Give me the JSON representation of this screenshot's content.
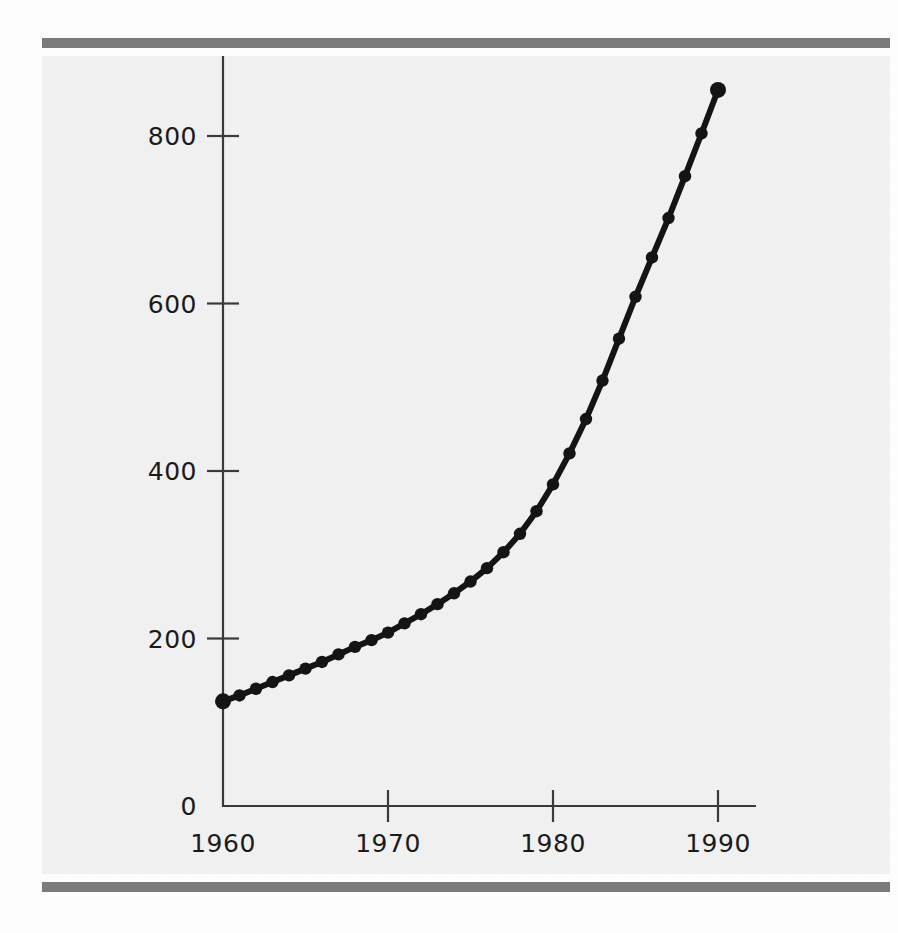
{
  "figure": {
    "background_color": "#f1f1f1",
    "rule_color": "#7b7b7b",
    "ink_color": "#141414",
    "axis_color": "#3a3a3a"
  },
  "chart_data": {
    "type": "line",
    "title": "",
    "subtitle": "",
    "xlabel": "",
    "ylabel": "",
    "xlim": [
      1960,
      1990
    ],
    "ylim": [
      0,
      900
    ],
    "xticks": [
      1960,
      1970,
      1980,
      1990
    ],
    "xtick_labels": [
      "1960",
      "1970",
      "1980",
      "1990"
    ],
    "yticks": [
      0,
      200,
      400,
      600,
      800
    ],
    "ytick_labels": [
      "0",
      "200",
      "400",
      "600",
      "800"
    ],
    "grid": false,
    "legend": null,
    "markers": "filled-circle",
    "annotations": [],
    "series": [
      {
        "name": "series-1",
        "color": "#141414",
        "x": [
          1960,
          1961,
          1962,
          1963,
          1964,
          1965,
          1966,
          1967,
          1968,
          1969,
          1970,
          1971,
          1972,
          1973,
          1974,
          1975,
          1976,
          1977,
          1978,
          1979,
          1980,
          1981,
          1982,
          1983,
          1984,
          1985,
          1986,
          1987,
          1988,
          1989,
          1990
        ],
        "values": [
          125,
          132,
          140,
          148,
          156,
          164,
          172,
          181,
          190,
          198,
          207,
          218,
          229,
          241,
          254,
          268,
          284,
          303,
          325,
          352,
          384,
          421,
          462,
          508,
          558,
          608,
          655,
          702,
          752,
          803,
          855
        ]
      }
    ]
  }
}
